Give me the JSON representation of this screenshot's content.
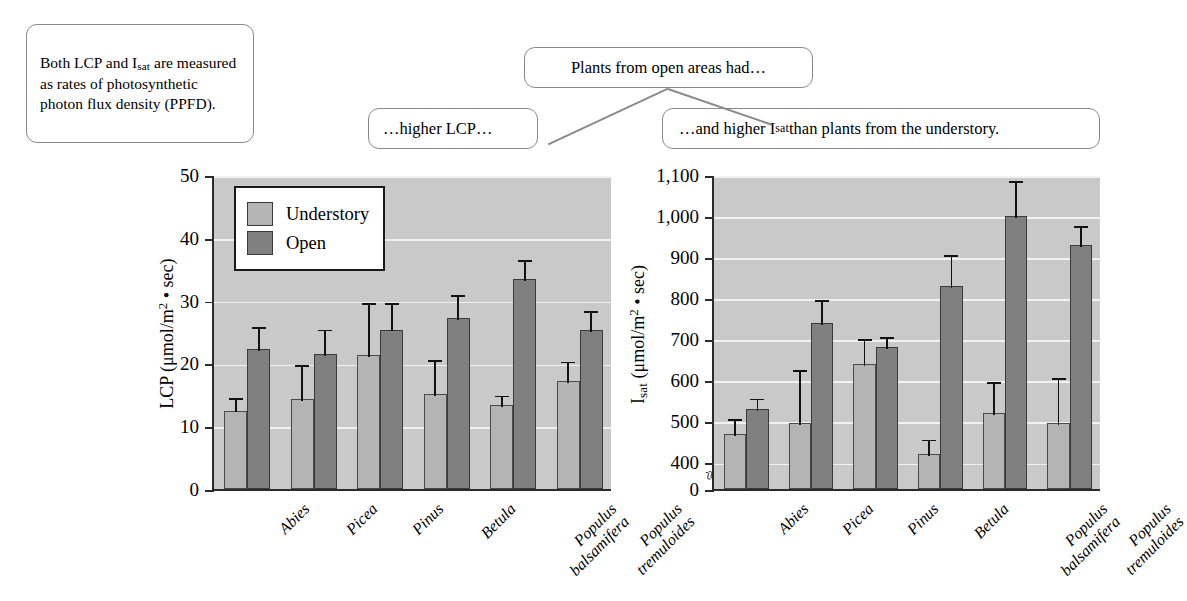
{
  "callouts": {
    "ppfd": {
      "text_line1": "Both LCP and I",
      "text_sub": "sat",
      "text_line2": " are measured as rates of photosynthetic photon flux density (PPFD)."
    },
    "open_areas": "Plants from open areas had…",
    "higher_lcp": "…higher LCP…",
    "higher_isat_pre": "…and higher I",
    "higher_isat_sub": "sat",
    "higher_isat_post": " than plants from the understory."
  },
  "legend": {
    "understory_label": "Understory",
    "open_label": "Open",
    "understory_color": "#b4b4b4",
    "open_color": "#808080"
  },
  "bottom_caption": "",
  "chart_data": [
    {
      "id": "lcp",
      "type": "bar",
      "title": "",
      "ylabel_pre": "LCP (μmol/m",
      "ylabel_sup": "2",
      "ylabel_post": " • sec)",
      "xlabel": "",
      "ylim": [
        0,
        50
      ],
      "yticks": [
        0,
        10,
        20,
        30,
        40,
        50
      ],
      "yticklabels": [
        "0",
        "10",
        "20",
        "30",
        "40",
        "50"
      ],
      "grid": true,
      "axis_break": false,
      "legend_position": "top-left",
      "categories": [
        "Abies",
        "Picea",
        "Pinus",
        "Betula",
        "Populus balsamifera",
        "Populus tremuloides"
      ],
      "series": [
        {
          "name": "Understory",
          "color": "#b4b4b4",
          "values": [
            12.5,
            14.3,
            21.4,
            15.1,
            13.3,
            17.2
          ],
          "errors": [
            2.3,
            5.7,
            8.5,
            5.8,
            1.9,
            3.4
          ]
        },
        {
          "name": "Open",
          "color": "#808080",
          "values": [
            22.3,
            21.5,
            25.4,
            27.3,
            33.5,
            25.3
          ],
          "errors": [
            3.8,
            4.2,
            4.5,
            3.9,
            3.3,
            3.4
          ]
        }
      ]
    },
    {
      "id": "isat",
      "type": "bar",
      "title": "",
      "ylabel_pre": "I",
      "ylabel_sub": "sat",
      "ylabel_mid": " (μmol/m",
      "ylabel_sup": "2",
      "ylabel_post": " • sec)",
      "xlabel": "",
      "ylim": [
        0,
        1100
      ],
      "yticks": [
        0,
        400,
        500,
        600,
        700,
        800,
        900,
        1000,
        1100
      ],
      "yticklabels": [
        "0",
        "400",
        "500",
        "600",
        "700",
        "800",
        "900",
        "1,000",
        "1,100"
      ],
      "grid": true,
      "axis_break": true,
      "axis_break_value": 200,
      "legend_position": "none",
      "categories": [
        "Abies",
        "Picea",
        "Pinus",
        "Betula",
        "Populus balsamifera",
        "Populus tremuloides"
      ],
      "series": [
        {
          "name": "Understory",
          "color": "#b4b4b4",
          "values": [
            470,
            495,
            640,
            420,
            520,
            495
          ],
          "errors": [
            40,
            135,
            65,
            40,
            80,
            115
          ]
        },
        {
          "name": "Open",
          "color": "#808080",
          "values": [
            530,
            740,
            680,
            830,
            1000,
            930
          ],
          "errors": [
            30,
            60,
            30,
            80,
            90,
            50
          ]
        }
      ]
    }
  ]
}
